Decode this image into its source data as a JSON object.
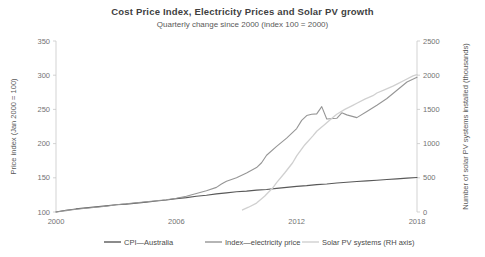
{
  "chart_data": {
    "type": "line",
    "title": "Cost Price Index, Electricity Prices and Solar PV growth",
    "subtitle": "Quarterly change since 2000 (index 100 = 2000)",
    "xlabel": "",
    "ylabel": "Price index (Jan 2000 = 100)",
    "y2label": "Number of solar PV systems installed (thousands)",
    "xlim": [
      2000,
      2018
    ],
    "ylim": [
      100,
      350
    ],
    "y2lim": [
      0,
      2500
    ],
    "xticks": [
      2000,
      2006,
      2012,
      2018
    ],
    "yticks": [
      100,
      150,
      200,
      250,
      300,
      350
    ],
    "y2ticks": [
      0,
      500,
      1000,
      1500,
      2000,
      2500
    ],
    "grid": false,
    "legend_position": "bottom",
    "colors": {
      "cpi": "#595959",
      "electricity": "#969696",
      "solar": "#d0d0d0"
    },
    "series": [
      {
        "name": "CPI—Australia",
        "axis": "left",
        "color": "#595959",
        "x": [
          2000,
          2000.5,
          2001,
          2001.5,
          2002,
          2002.5,
          2003,
          2003.5,
          2004,
          2004.5,
          2005,
          2005.5,
          2006,
          2006.5,
          2007,
          2007.5,
          2008,
          2008.5,
          2009,
          2009.5,
          2010,
          2010.5,
          2011,
          2011.5,
          2012,
          2012.5,
          2013,
          2013.5,
          2014,
          2014.5,
          2015,
          2015.5,
          2016,
          2016.5,
          2017,
          2017.5,
          2018
        ],
        "values": [
          100,
          102.5,
          104.5,
          106,
          107.5,
          109,
          110.5,
          111.5,
          113,
          114.5,
          116,
          117.5,
          119.5,
          121,
          123,
          124.5,
          126.5,
          128,
          129.5,
          130.5,
          132,
          133,
          134.5,
          136,
          137.5,
          138.5,
          140,
          141,
          142.5,
          143.5,
          144.5,
          145.5,
          146.5,
          147.5,
          148.5,
          149.5,
          150.5
        ]
      },
      {
        "name": "Index—electricity price",
        "axis": "left",
        "color": "#969696",
        "x": [
          2000,
          2000.5,
          2001,
          2001.5,
          2002,
          2002.5,
          2003,
          2003.5,
          2004,
          2004.5,
          2005,
          2005.5,
          2006,
          2006.5,
          2007,
          2007.5,
          2008,
          2008.25,
          2008.5,
          2009,
          2009.5,
          2010,
          2010.25,
          2010.5,
          2011,
          2011.5,
          2012,
          2012.25,
          2012.5,
          2012.75,
          2013,
          2013.25,
          2013.5,
          2014,
          2014.25,
          2014.5,
          2015,
          2015.5,
          2016,
          2016.5,
          2017,
          2017.5,
          2018
        ],
        "values": [
          100,
          102,
          104,
          105.5,
          107,
          108.5,
          110.5,
          112,
          113.5,
          115,
          116.5,
          118,
          120,
          123,
          127,
          131,
          136,
          141,
          145,
          150,
          157,
          165,
          172,
          183,
          196,
          208,
          222,
          234,
          241,
          243,
          243.5,
          254,
          236,
          237,
          245,
          242,
          238,
          247,
          256,
          266,
          278,
          290,
          297
        ]
      },
      {
        "name": "Solar PV systems (RH axis)",
        "axis": "right",
        "color": "#d0d0d0",
        "x": [
          2009.3,
          2009.6,
          2010,
          2010.4,
          2010.8,
          2011,
          2011.4,
          2011.8,
          2012,
          2012.4,
          2012.8,
          2013,
          2013.4,
          2013.8,
          2014,
          2014.4,
          2014.8,
          2015,
          2015.4,
          2015.8,
          2016,
          2016.4,
          2016.8,
          2017,
          2017.4,
          2017.8,
          2018
        ],
        "values": [
          30,
          70,
          130,
          230,
          350,
          430,
          570,
          720,
          820,
          980,
          1110,
          1180,
          1280,
          1380,
          1430,
          1500,
          1560,
          1590,
          1650,
          1700,
          1740,
          1790,
          1840,
          1870,
          1930,
          1990,
          2010
        ]
      }
    ]
  },
  "legend": {
    "items": [
      {
        "label": "CPI—Australia",
        "color": "#595959"
      },
      {
        "label": "Index—electricity price",
        "color": "#969696"
      },
      {
        "label": "Solar PV systems (RH axis)",
        "color": "#d0d0d0"
      }
    ]
  }
}
